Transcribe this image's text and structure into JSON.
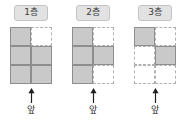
{
  "diagram": {
    "grid": {
      "columns": 2,
      "rows": 3
    },
    "colors": {
      "filled_cell": "#c9c9c9",
      "filled_border": "#8e8e8e",
      "empty_border": "#b0b0b0",
      "label_chip_bg": "#e2e2e2",
      "label_chip_border": "#c4c4c4",
      "arrow": "#1f1f1f",
      "background": "#ffffff"
    },
    "arrow_icon_name": "up-arrow-icon",
    "floors": [
      {
        "label": "1층",
        "front_label": "앞",
        "cells": [
          {
            "filled": true
          },
          {
            "filled": false
          },
          {
            "filled": true
          },
          {
            "filled": true
          },
          {
            "filled": true
          },
          {
            "filled": true
          }
        ]
      },
      {
        "label": "2층",
        "front_label": "앞",
        "cells": [
          {
            "filled": true
          },
          {
            "filled": false
          },
          {
            "filled": true
          },
          {
            "filled": true
          },
          {
            "filled": true
          },
          {
            "filled": false
          }
        ]
      },
      {
        "label": "3층",
        "front_label": "앞",
        "cells": [
          {
            "filled": true
          },
          {
            "filled": false
          },
          {
            "filled": false
          },
          {
            "filled": true
          },
          {
            "filled": false
          },
          {
            "filled": false
          }
        ]
      }
    ]
  }
}
